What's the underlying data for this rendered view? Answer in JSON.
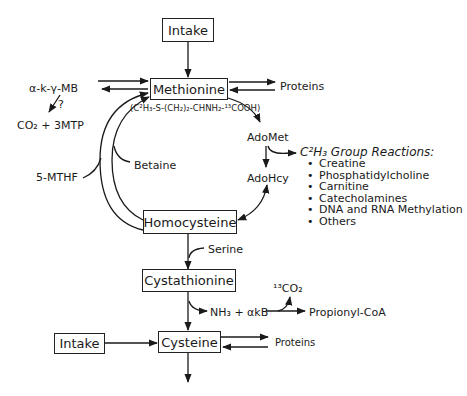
{
  "diagram": {
    "nodes": {
      "intake_top": "Intake",
      "methionine": "Methionine",
      "methionine_formula": "(C²H₃-S-(CH₂)₂-CHNH₂-¹³COOH)",
      "homocysteine": "Homocysteine",
      "cystathionine": "Cystathionine",
      "cysteine": "Cysteine",
      "intake_bottom": "Intake"
    },
    "labels": {
      "akmb": "α-k-γ-MB",
      "question": "?",
      "co2_3mtp": "CO₂ + 3MTP",
      "mthf": "5-MTHF",
      "betaine": "Betaine",
      "proteins_top": "Proteins",
      "adomet": "AdoMet",
      "adohcy": "AdoHcy",
      "serine": "Serine",
      "nh3_akb": "NH₃ + αkB",
      "co2_13": "¹³CO₂",
      "propionyl": "Propionyl-CoA",
      "proteins_bottom": "Proteins"
    },
    "group_reactions": {
      "heading": "C²H₃ Group Reactions:",
      "items": [
        "Creatine",
        "Phosphatidylcholine",
        "Carnitine",
        "Catecholamines",
        "DNA and RNA Methylation",
        "Others"
      ]
    }
  }
}
